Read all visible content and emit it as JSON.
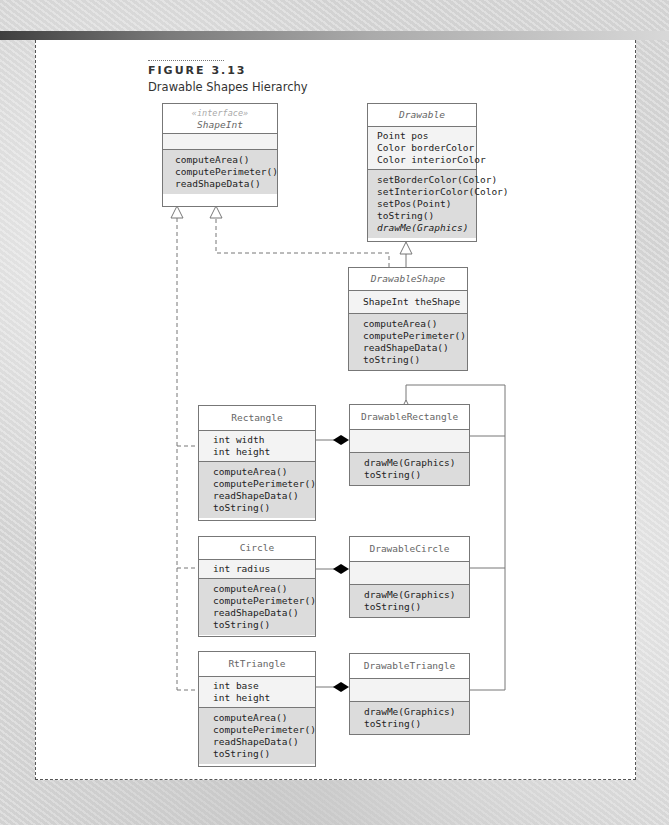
{
  "figure": {
    "label": "FIGURE 3.13",
    "caption": "Drawable Shapes Hierarchy"
  },
  "classes": {
    "shapeint": {
      "stereotype": "«interface»",
      "name": "ShapeInt",
      "attributes": [],
      "operations": [
        "computeArea()",
        "computePerimeter()",
        "readShapeData()"
      ]
    },
    "drawable": {
      "name": "Drawable",
      "attributes": [
        "Point pos",
        "Color borderColor",
        "Color interiorColor"
      ],
      "operations": [
        "setBorderColor(Color)",
        "setInteriorColor(Color)",
        "setPos(Point)",
        "toString()",
        "drawMe(Graphics)"
      ]
    },
    "drawableshape": {
      "name": "DrawableShape",
      "attributes": [
        "ShapeInt theShape"
      ],
      "operations": [
        "computeArea()",
        "computePerimeter()",
        "readShapeData()",
        "toString()"
      ]
    },
    "rectangle": {
      "name": "Rectangle",
      "attributes": [
        "int width",
        "int height"
      ],
      "operations": [
        "computeArea()",
        "computePerimeter()",
        "readShapeData()",
        "toString()"
      ]
    },
    "drawablerectangle": {
      "name": "DrawableRectangle",
      "attributes": [],
      "operations": [
        "drawMe(Graphics)",
        "toString()"
      ]
    },
    "circle": {
      "name": "Circle",
      "attributes": [
        "int radius"
      ],
      "operations": [
        "computeArea()",
        "computePerimeter()",
        "readShapeData()",
        "toString()"
      ]
    },
    "drawablecircle": {
      "name": "DrawableCircle",
      "attributes": [],
      "operations": [
        "drawMe(Graphics)",
        "toString()"
      ]
    },
    "rttriangle": {
      "name": "RtTriangle",
      "attributes": [
        "int base",
        "int height"
      ],
      "operations": [
        "computeArea()",
        "computePerimeter()",
        "readShapeData()",
        "toString()"
      ]
    },
    "drawabletriangle": {
      "name": "DrawableTriangle",
      "attributes": [],
      "operations": [
        "drawMe(Graphics)",
        "toString()"
      ]
    }
  },
  "relationships": [
    {
      "from": "DrawableShape",
      "to": "Drawable",
      "type": "inheritance"
    },
    {
      "from": "DrawableShape",
      "to": "ShapeInt",
      "type": "realization"
    },
    {
      "from": "Rectangle",
      "to": "ShapeInt",
      "type": "realization"
    },
    {
      "from": "Circle",
      "to": "ShapeInt",
      "type": "realization"
    },
    {
      "from": "RtTriangle",
      "to": "ShapeInt",
      "type": "realization"
    },
    {
      "from": "DrawableRectangle",
      "to": "DrawableShape",
      "type": "inheritance"
    },
    {
      "from": "DrawableCircle",
      "to": "DrawableShape",
      "type": "inheritance"
    },
    {
      "from": "DrawableTriangle",
      "to": "DrawableShape",
      "type": "inheritance"
    },
    {
      "from": "DrawableRectangle",
      "to": "Rectangle",
      "type": "composition"
    },
    {
      "from": "DrawableCircle",
      "to": "Circle",
      "type": "composition"
    },
    {
      "from": "DrawableTriangle",
      "to": "RtTriangle",
      "type": "composition"
    }
  ]
}
